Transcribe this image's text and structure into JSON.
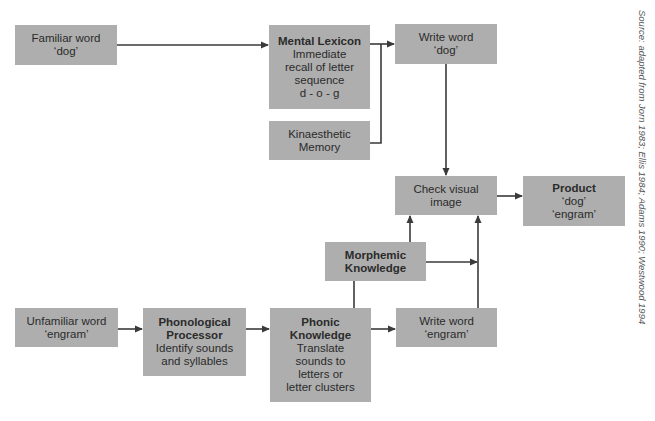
{
  "diagram": {
    "nodes": {
      "familiar_word": {
        "lines": [
          "Familiar word",
          "‘dog’"
        ]
      },
      "mental_lexicon": {
        "title": "Mental Lexicon",
        "lines": [
          "Immediate",
          "recall of letter",
          "sequence",
          "d - o - g"
        ]
      },
      "write_word_dog": {
        "lines": [
          "Write word",
          "‘dog’"
        ]
      },
      "kinaesthetic_memory": {
        "lines": [
          "Kinaesthetic",
          "Memory"
        ]
      },
      "check_visual_image": {
        "lines": [
          "Check visual",
          "image"
        ]
      },
      "product": {
        "title": "Product",
        "lines": [
          "‘dog’",
          "‘engram’"
        ]
      },
      "morphemic_knowledge": {
        "title_lines": [
          "Morphemic",
          "Knowledge"
        ]
      },
      "unfamiliar_word": {
        "lines": [
          "Unfamiliar word",
          "‘engram’"
        ]
      },
      "phonological_processor": {
        "title_lines": [
          "Phonological",
          "Processor"
        ],
        "lines": [
          "Identify sounds",
          "and syllables"
        ]
      },
      "phonic_knowledge": {
        "title_lines": [
          "Phonic",
          "Knowledge"
        ],
        "lines": [
          "Translate",
          "sounds to",
          "letters or",
          "letter clusters"
        ]
      },
      "write_word_engram": {
        "lines": [
          "Write word",
          "‘engram’"
        ]
      }
    },
    "edges": [
      {
        "from": "familiar_word",
        "to": "mental_lexicon"
      },
      {
        "from": "mental_lexicon",
        "to": "write_word_dog"
      },
      {
        "from": "kinaesthetic_memory",
        "to": "write_word_dog"
      },
      {
        "from": "write_word_dog",
        "to": "check_visual_image"
      },
      {
        "from": "check_visual_image",
        "to": "product"
      },
      {
        "from": "morphemic_knowledge",
        "to": "check_visual_image"
      },
      {
        "from": "morphemic_knowledge",
        "to": "write_word_engram_path"
      },
      {
        "from": "unfamiliar_word",
        "to": "phonological_processor"
      },
      {
        "from": "phonological_processor",
        "to": "phonic_knowledge"
      },
      {
        "from": "phonic_knowledge",
        "to": "morphemic_knowledge"
      },
      {
        "from": "phonic_knowledge",
        "to": "write_word_engram"
      },
      {
        "from": "write_word_engram",
        "to": "check_visual_image"
      }
    ],
    "colors": {
      "box": "#aeaeae",
      "line": "#3a3a3a",
      "text": "#2b2b2b"
    }
  },
  "source_note": "Source: adapted from Jorn 1983; Ellis 1984; Adams 1990; Westwood 1994"
}
